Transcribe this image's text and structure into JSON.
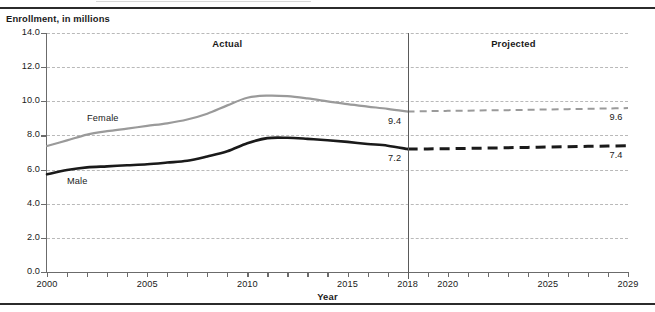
{
  "figure": {
    "y_axis_title": "Enrollment, in millions",
    "x_axis_title": "Year"
  },
  "annotations": {
    "actual": "Actual",
    "projected": "Projected",
    "female_series_label": "Female",
    "male_series_label": "Male",
    "female_2018_value": "9.4",
    "female_2029_value": "9.6",
    "male_2018_value": "7.2",
    "male_2029_value": "7.4"
  },
  "colors": {
    "female_line": "#9a9a9a",
    "male_line": "#1a1a1a",
    "gridline": "#b9b9b9",
    "axis": "#6b6b6b",
    "divider": "#5a5a5a",
    "rule": "#2b2b2b"
  },
  "chart_data": {
    "type": "line",
    "title": "",
    "subtitle": "",
    "xlabel": "Year",
    "ylabel": "Enrollment, in millions",
    "xlim": [
      2000,
      2029
    ],
    "ylim": [
      0.0,
      14.0
    ],
    "grid": true,
    "legend": "inline-labels",
    "y_ticks": [
      "0.0",
      "2.0",
      "4.0",
      "6.0",
      "8.0",
      "10.0",
      "12.0",
      "14.0"
    ],
    "y_tick_values": [
      0.0,
      2.0,
      4.0,
      6.0,
      8.0,
      10.0,
      12.0,
      14.0
    ],
    "x_tick_labels": [
      "2000",
      "2005",
      "2010",
      "2015",
      "2018",
      "2020",
      "2025",
      "2029"
    ],
    "x_tick_values": [
      2000,
      2005,
      2010,
      2015,
      2018,
      2020,
      2025,
      2029
    ],
    "x_minor_ticks": [
      2000,
      2001,
      2002,
      2003,
      2004,
      2005,
      2006,
      2007,
      2008,
      2009,
      2010,
      2011,
      2012,
      2013,
      2014,
      2015,
      2016,
      2017,
      2018,
      2019,
      2020,
      2021,
      2022,
      2023,
      2024,
      2025,
      2026,
      2027,
      2028,
      2029
    ],
    "divider_x": 2018,
    "divider_note": "solid line separating Actual (left) from Projected (right)",
    "x": [
      2000,
      2001,
      2002,
      2003,
      2004,
      2005,
      2006,
      2007,
      2008,
      2009,
      2010,
      2011,
      2012,
      2013,
      2014,
      2015,
      2016,
      2017,
      2018,
      2019,
      2020,
      2021,
      2022,
      2023,
      2024,
      2025,
      2026,
      2027,
      2028,
      2029
    ],
    "series": [
      {
        "name": "Female",
        "color": "#9a9a9a",
        "style_actual": "solid",
        "style_projected": "dashed",
        "values": [
          7.38,
          7.71,
          8.05,
          8.25,
          8.4,
          8.56,
          8.71,
          8.93,
          9.27,
          9.76,
          10.21,
          10.33,
          10.3,
          10.17,
          10.0,
          9.83,
          9.69,
          9.56,
          9.4,
          9.42,
          9.44,
          9.45,
          9.47,
          9.48,
          9.5,
          9.52,
          9.54,
          9.56,
          9.58,
          9.6
        ]
      },
      {
        "name": "Male",
        "color": "#1a1a1a",
        "style_actual": "solid",
        "style_projected": "dashed",
        "values": [
          5.72,
          5.97,
          6.13,
          6.19,
          6.25,
          6.31,
          6.41,
          6.52,
          6.77,
          7.07,
          7.54,
          7.84,
          7.86,
          7.8,
          7.72,
          7.62,
          7.5,
          7.4,
          7.2,
          7.21,
          7.22,
          7.24,
          7.26,
          7.28,
          7.3,
          7.32,
          7.34,
          7.36,
          7.38,
          7.4
        ]
      }
    ],
    "point_labels": [
      {
        "series": "Female",
        "x": 2018,
        "text": "9.4"
      },
      {
        "series": "Female",
        "x": 2029,
        "text": "9.6"
      },
      {
        "series": "Male",
        "x": 2018,
        "text": "7.2"
      },
      {
        "series": "Male",
        "x": 2029,
        "text": "7.4"
      }
    ]
  }
}
